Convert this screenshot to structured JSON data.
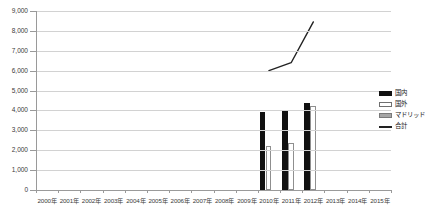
{
  "chart_data": {
    "type": "bar",
    "title": "",
    "xlabel": "",
    "ylabel": "",
    "ylim": [
      0,
      9000
    ],
    "ytick_step": 1000,
    "grid": true,
    "legend_position": "right",
    "categories": [
      "2000年",
      "2001年",
      "2002年",
      "2003年",
      "2004年",
      "2005年",
      "2006年",
      "2007年",
      "2008年",
      "2009年",
      "2010年",
      "2011年",
      "2012年",
      "2013年",
      "2014年",
      "2015年"
    ],
    "ytick_labels": [
      "9,000",
      "8,000",
      "7,000",
      "6,000",
      "5,000",
      "4,000",
      "3,000",
      "2,000",
      "1,000",
      "0"
    ],
    "series": [
      {
        "name": "国内",
        "type": "bar",
        "color": "#111111",
        "values": [
          null,
          null,
          null,
          null,
          null,
          null,
          null,
          null,
          null,
          null,
          3900,
          3950,
          4400,
          null,
          null,
          null
        ]
      },
      {
        "name": "国外",
        "type": "bar",
        "color": "#ffffff",
        "values": [
          null,
          null,
          null,
          null,
          null,
          null,
          null,
          null,
          null,
          null,
          2200,
          2350,
          4200,
          null,
          null,
          null
        ]
      },
      {
        "name": "マドリッド",
        "type": "bar",
        "color": "#a6a6a6",
        "values": [
          null,
          null,
          null,
          null,
          null,
          null,
          null,
          null,
          null,
          null,
          null,
          null,
          null,
          null,
          null,
          null
        ]
      },
      {
        "name": "合計",
        "type": "line",
        "color": "#222222",
        "values": [
          null,
          null,
          null,
          null,
          null,
          null,
          null,
          null,
          null,
          null,
          6000,
          6400,
          8450,
          null,
          null,
          null
        ]
      }
    ]
  },
  "legend": {
    "items": [
      {
        "label": "国内",
        "swatch": "filled-black-swatch"
      },
      {
        "label": "国外",
        "swatch": "outline-white-swatch"
      },
      {
        "label": "マドリッド",
        "swatch": "filled-gray-swatch"
      },
      {
        "label": "合計",
        "swatch": "line-swatch"
      }
    ]
  }
}
